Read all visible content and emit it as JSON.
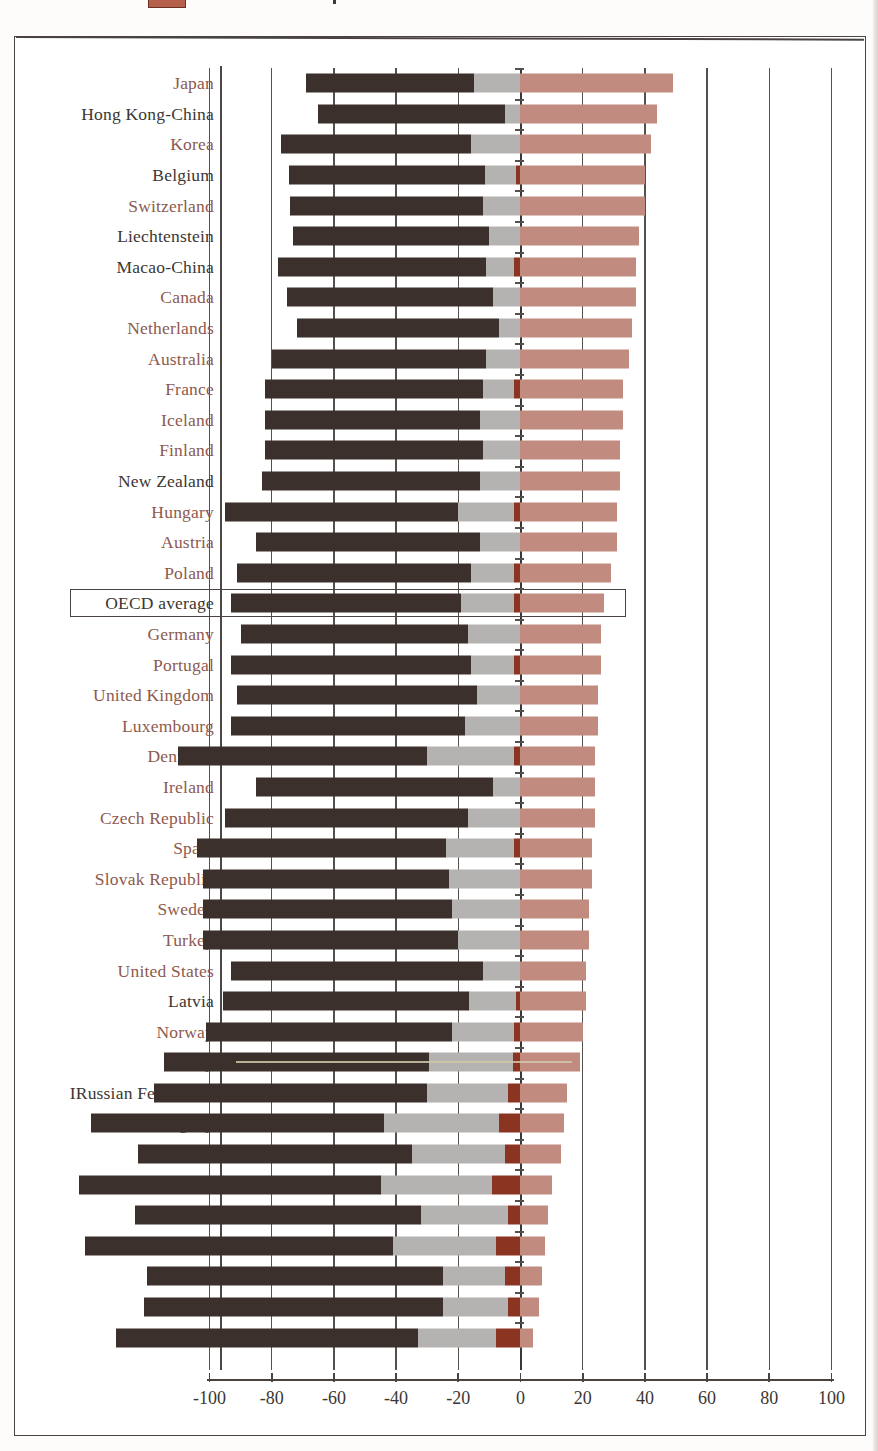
{
  "legend": {
    "swatch_color": "#b4604a",
    "note": "cropped legend swatch and tick visible at top edge"
  },
  "colors": {
    "dark_brown": "#3b302b",
    "gray": "#b5b3b1",
    "dark_red": "#8c3422",
    "rose": "#c18b80",
    "label_accent": "#8d5a4e",
    "label_plain": "#3c3733",
    "frame": "#4a4340"
  },
  "highlight_row": "OECD average",
  "chart_data": {
    "type": "bar",
    "orientation": "horizontal",
    "stacked": true,
    "title": "",
    "subtitle": "",
    "xlabel": "",
    "ylabel": "",
    "xlim": [
      -100,
      100
    ],
    "xticks": [
      -100,
      -80,
      -60,
      -40,
      -20,
      0,
      20,
      40,
      60,
      80,
      100
    ],
    "xtick_labels": [
      "-100",
      "-80",
      "-60",
      "-40",
      "-20",
      "0",
      "20",
      "40",
      "60",
      "80",
      "100"
    ],
    "grid": true,
    "legend_position": "top-cropped",
    "series": [
      {
        "name": "dark-brown-segment",
        "color": "#3b302b",
        "side": "negative"
      },
      {
        "name": "gray-segment",
        "color": "#b5b3b1",
        "side": "negative"
      },
      {
        "name": "dark-red-segment",
        "color": "#8c3422",
        "side": "negative"
      },
      {
        "name": "rose-segment",
        "color": "#c18b80",
        "side": "positive"
      }
    ],
    "categories": [
      "Japan",
      "Hong Kong-China",
      "Korea",
      "Belgium",
      "Switzerland",
      "Liechtenstein",
      "Macao-China",
      "Canada",
      "Netherlands",
      "Australia",
      "France",
      "Iceland",
      "Finland",
      "New Zealand",
      "Hungary",
      "Austria",
      "Poland",
      "OECD average",
      "Germany",
      "Portugal",
      "United Kingdom",
      "Luxembourg",
      "Denmark",
      "Ireland",
      "Czech Republic",
      "Spain",
      "Slovak Republic",
      "Sweden",
      "Turkey",
      "United States",
      "Latvia",
      "Norway",
      "Italy",
      "IRussian Federation",
      "Uruguay",
      "Greece",
      "Brazil",
      "Serbia",
      "Tunisia",
      "Thailand",
      "Mexico",
      "Indonesia"
    ],
    "rows": [
      {
        "label": "Japan",
        "accent": true,
        "dark": -54,
        "gray": -15,
        "darkred": 0,
        "rose": 49
      },
      {
        "label": "Hong Kong-China",
        "accent": false,
        "dark": -60,
        "gray": -5,
        "darkred": 0,
        "rose": 44
      },
      {
        "label": "Korea",
        "accent": true,
        "dark": -61,
        "gray": -16,
        "darkred": 0,
        "rose": 42
      },
      {
        "label": "Belgium",
        "accent": false,
        "dark": -63,
        "gray": -10,
        "darkred": -1.5,
        "rose": 40
      },
      {
        "label": "Switzerland",
        "accent": true,
        "dark": -62,
        "gray": -12,
        "darkred": 0,
        "rose": 40
      },
      {
        "label": "Liechtenstein",
        "accent": false,
        "dark": -63,
        "gray": -10,
        "darkred": 0,
        "rose": 38
      },
      {
        "label": "Macao-China",
        "accent": false,
        "dark": -67,
        "gray": -9,
        "darkred": -2,
        "rose": 37
      },
      {
        "label": "Canada",
        "accent": true,
        "dark": -66,
        "gray": -9,
        "darkred": 0,
        "rose": 37
      },
      {
        "label": "Netherlands",
        "accent": true,
        "dark": -65,
        "gray": -7,
        "darkred": 0,
        "rose": 36
      },
      {
        "label": "Australia",
        "accent": true,
        "dark": -69,
        "gray": -11,
        "darkred": 0,
        "rose": 35
      },
      {
        "label": "France",
        "accent": true,
        "dark": -70,
        "gray": -10,
        "darkred": -2,
        "rose": 33
      },
      {
        "label": "Iceland",
        "accent": true,
        "dark": -69,
        "gray": -13,
        "darkred": 0,
        "rose": 33
      },
      {
        "label": "Finland",
        "accent": true,
        "dark": -70,
        "gray": -12,
        "darkred": 0,
        "rose": 32
      },
      {
        "label": "New Zealand",
        "accent": false,
        "dark": -70,
        "gray": -13,
        "darkred": 0,
        "rose": 32
      },
      {
        "label": "Hungary",
        "accent": true,
        "dark": -75,
        "gray": -18,
        "darkred": -2,
        "rose": 31
      },
      {
        "label": "Austria",
        "accent": true,
        "dark": -72,
        "gray": -13,
        "darkred": 0,
        "rose": 31
      },
      {
        "label": "Poland",
        "accent": true,
        "dark": -75,
        "gray": -14,
        "darkred": -2,
        "rose": 29
      },
      {
        "label": "OECD average",
        "accent": false,
        "dark": -74,
        "gray": -17,
        "darkred": -2,
        "rose": 27
      },
      {
        "label": "Germany",
        "accent": true,
        "dark": -73,
        "gray": -17,
        "darkred": 0,
        "rose": 26
      },
      {
        "label": "Portugal",
        "accent": true,
        "dark": -77,
        "gray": -14,
        "darkred": -2,
        "rose": 26
      },
      {
        "label": "United Kingdom",
        "accent": true,
        "dark": -77,
        "gray": -14,
        "darkred": 0,
        "rose": 25
      },
      {
        "label": "Luxembourg",
        "accent": true,
        "dark": -75,
        "gray": -18,
        "darkred": 0,
        "rose": 25
      },
      {
        "label": "Denmark",
        "accent": true,
        "dark": -80,
        "gray": -28,
        "darkred": -2,
        "rose": 24
      },
      {
        "label": "Ireland",
        "accent": true,
        "dark": -76,
        "gray": -9,
        "darkred": 0,
        "rose": 24
      },
      {
        "label": "Czech Republic",
        "accent": true,
        "dark": -78,
        "gray": -17,
        "darkred": 0,
        "rose": 24
      },
      {
        "label": "Spain",
        "accent": true,
        "dark": -80,
        "gray": -22,
        "darkred": -2,
        "rose": 23
      },
      {
        "label": "Slovak Republic",
        "accent": true,
        "dark": -79,
        "gray": -23,
        "darkred": 0,
        "rose": 23
      },
      {
        "label": "Sweden",
        "accent": true,
        "dark": -80,
        "gray": -22,
        "darkred": 0,
        "rose": 22
      },
      {
        "label": "Turkey",
        "accent": true,
        "dark": -82,
        "gray": -20,
        "darkred": 0,
        "rose": 22
      },
      {
        "label": "United States",
        "accent": true,
        "dark": -81,
        "gray": -12,
        "darkred": 0,
        "rose": 21
      },
      {
        "label": "Latvia",
        "accent": false,
        "dark": -79,
        "gray": -15,
        "darkred": -1.5,
        "rose": 21
      },
      {
        "label": "Norway",
        "accent": true,
        "dark": -79,
        "gray": -20,
        "darkred": -2,
        "rose": 20
      },
      {
        "label": "Italy",
        "accent": true,
        "dark": -85,
        "gray": -27,
        "darkred": -2.5,
        "rose": 19
      },
      {
        "label": "IRussian Federation",
        "accent": false,
        "dark": -88,
        "gray": -26,
        "darkred": -4,
        "rose": 15
      },
      {
        "label": "Uruguay",
        "accent": false,
        "dark": -94,
        "gray": -37,
        "darkred": -7,
        "rose": 14
      },
      {
        "label": "Greece",
        "accent": true,
        "dark": -88,
        "gray": -30,
        "darkred": -5,
        "rose": 13
      },
      {
        "label": "Brazil",
        "accent": false,
        "dark": -97,
        "gray": -36,
        "darkred": -9,
        "rose": 10
      },
      {
        "label": "Serbia",
        "accent": false,
        "dark": -92,
        "gray": -28,
        "darkred": -4,
        "rose": 9
      },
      {
        "label": "Tunisia",
        "accent": false,
        "dark": -99,
        "gray": -33,
        "darkred": -8,
        "rose": 8
      },
      {
        "label": "Thailand",
        "accent": false,
        "dark": -95,
        "gray": -20,
        "darkred": -5,
        "rose": 7
      },
      {
        "label": "Mexico",
        "accent": true,
        "dark": -96,
        "gray": -21,
        "darkred": -4,
        "rose": 6
      },
      {
        "label": "Indonesia",
        "accent": false,
        "dark": -97,
        "gray": -25,
        "darkred": -8,
        "rose": 4
      }
    ]
  }
}
